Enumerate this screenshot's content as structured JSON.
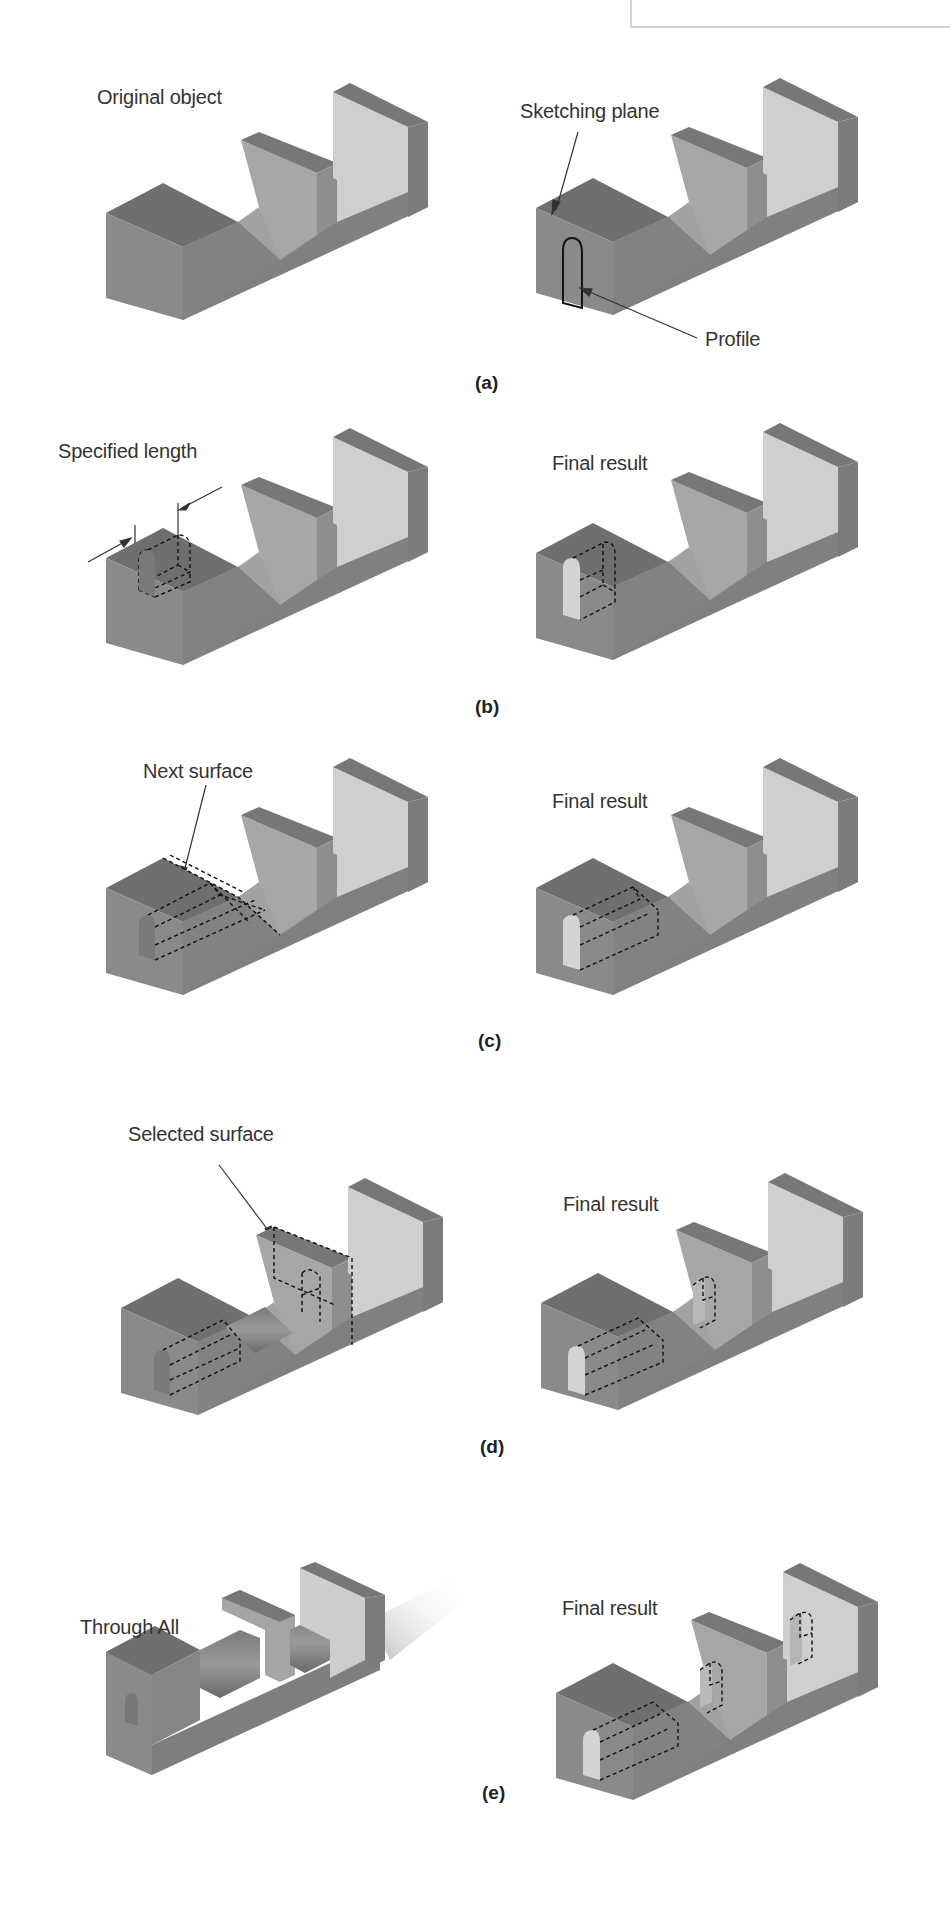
{
  "header": {
    "fragment_left": "p",
    "fragment_right": "g"
  },
  "colors": {
    "top_dark": "#6f6f6f",
    "front": "#8c8c8c",
    "side": "#7e7e7e",
    "wall_face": "#a9a9a9",
    "wall_light": "#cfcfcf",
    "floor": "#9a9a9a",
    "dash": "#1a1a1a",
    "text": "#333333"
  },
  "panels": [
    {
      "id": "a",
      "label": "(a)",
      "left": {
        "callout": "Original object"
      },
      "right": {
        "callouts": [
          "Sketching plane",
          "Profile"
        ]
      }
    },
    {
      "id": "b",
      "label": "(b)",
      "left": {
        "callout": "Specified length"
      },
      "right": {
        "callout": "Final result"
      }
    },
    {
      "id": "c",
      "label": "(c)",
      "left": {
        "callout": "Next surface"
      },
      "right": {
        "callout": "Final result"
      }
    },
    {
      "id": "d",
      "label": "(d)",
      "left": {
        "callout": "Selected surface"
      },
      "right": {
        "callout": "Final result"
      }
    },
    {
      "id": "e",
      "label": "(e)",
      "left": {
        "callout": "Through All"
      },
      "right": {
        "callout": "Final result"
      }
    }
  ]
}
